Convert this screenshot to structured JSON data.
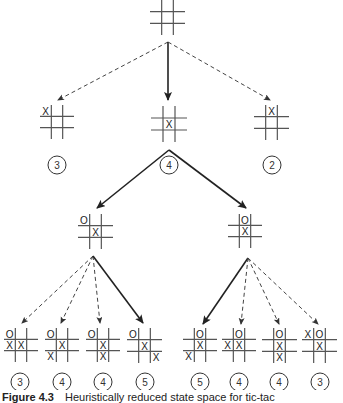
{
  "figure": {
    "label": "Figure 4.3",
    "caption": "Heuristically reduced state space for tic-tac"
  },
  "nodes": [
    {
      "id": "root",
      "x": 150,
      "y": 0,
      "size": 35,
      "marks": [],
      "score": null
    },
    {
      "id": "l1a",
      "x": 40,
      "y": 105,
      "size": 34,
      "marks": [
        {
          "r": 0,
          "c": 0,
          "v": "X"
        }
      ],
      "score": "3",
      "cx": 57,
      "cy": 165
    },
    {
      "id": "l1b",
      "x": 151,
      "y": 106,
      "size": 36,
      "marks": [
        {
          "r": 1,
          "c": 1,
          "v": "X"
        }
      ],
      "score": "4",
      "cx": 169,
      "cy": 165
    },
    {
      "id": "l1c",
      "x": 254,
      "y": 105,
      "size": 35,
      "marks": [
        {
          "r": 0,
          "c": 1,
          "v": "X"
        }
      ],
      "score": "2",
      "cx": 272,
      "cy": 165
    },
    {
      "id": "l2a",
      "x": 78,
      "y": 214,
      "size": 35,
      "marks": [
        {
          "r": 0,
          "c": 0,
          "v": "O"
        },
        {
          "r": 1,
          "c": 1,
          "v": "X"
        }
      ],
      "score": null
    },
    {
      "id": "l2b",
      "x": 228,
      "y": 214,
      "size": 34,
      "marks": [
        {
          "r": 0,
          "c": 1,
          "v": "O"
        },
        {
          "r": 1,
          "c": 1,
          "v": "X"
        }
      ],
      "score": null
    },
    {
      "id": "l3a",
      "x": 4,
      "y": 328,
      "size": 34,
      "marks": [
        {
          "r": 0,
          "c": 0,
          "v": "O"
        },
        {
          "r": 1,
          "c": 0,
          "v": "X"
        },
        {
          "r": 1,
          "c": 1,
          "v": "X"
        }
      ],
      "score": "3",
      "cx": 20,
      "cy": 382
    },
    {
      "id": "l3b",
      "x": 45,
      "y": 328,
      "size": 34,
      "marks": [
        {
          "r": 0,
          "c": 0,
          "v": "O"
        },
        {
          "r": 1,
          "c": 1,
          "v": "X"
        },
        {
          "r": 2,
          "c": 0,
          "v": "X"
        }
      ],
      "score": "4",
      "cx": 62,
      "cy": 382
    },
    {
      "id": "l3c",
      "x": 86,
      "y": 328,
      "size": 34,
      "marks": [
        {
          "r": 0,
          "c": 0,
          "v": "O"
        },
        {
          "r": 1,
          "c": 1,
          "v": "X"
        },
        {
          "r": 2,
          "c": 1,
          "v": "X"
        }
      ],
      "score": "4",
      "cx": 103,
      "cy": 382
    },
    {
      "id": "l3d",
      "x": 127,
      "y": 328,
      "size": 35,
      "marks": [
        {
          "r": 0,
          "c": 0,
          "v": "O"
        },
        {
          "r": 1,
          "c": 1,
          "v": "X"
        },
        {
          "r": 2,
          "c": 2,
          "v": "X"
        }
      ],
      "score": "5",
      "cx": 145,
      "cy": 382
    },
    {
      "id": "l3e",
      "x": 183,
      "y": 328,
      "size": 34,
      "marks": [
        {
          "r": 0,
          "c": 1,
          "v": "O"
        },
        {
          "r": 1,
          "c": 1,
          "v": "X"
        },
        {
          "r": 2,
          "c": 0,
          "v": "X"
        }
      ],
      "score": "5",
      "cx": 200,
      "cy": 382
    },
    {
      "id": "l3f",
      "x": 222,
      "y": 328,
      "size": 34,
      "marks": [
        {
          "r": 0,
          "c": 1,
          "v": "O"
        },
        {
          "r": 1,
          "c": 0,
          "v": "X"
        },
        {
          "r": 1,
          "c": 1,
          "v": "X"
        }
      ],
      "score": "4",
      "cx": 239,
      "cy": 382
    },
    {
      "id": "l3g",
      "x": 262,
      "y": 328,
      "size": 35,
      "marks": [
        {
          "r": 0,
          "c": 1,
          "v": "O"
        },
        {
          "r": 1,
          "c": 1,
          "v": "X"
        },
        {
          "r": 2,
          "c": 1,
          "v": "X"
        }
      ],
      "score": "4",
      "cx": 279,
      "cy": 382
    },
    {
      "id": "l3h",
      "x": 302,
      "y": 328,
      "size": 35,
      "marks": [
        {
          "r": 0,
          "c": 0,
          "v": "X"
        },
        {
          "r": 0,
          "c": 1,
          "v": "O"
        },
        {
          "r": 1,
          "c": 1,
          "v": "X"
        }
      ],
      "score": "3",
      "cx": 320,
      "cy": 382
    }
  ],
  "edges": [
    {
      "x1": 168,
      "y1": 42,
      "x2": 58,
      "y2": 100,
      "style": "dashed"
    },
    {
      "x1": 168,
      "y1": 42,
      "x2": 168,
      "y2": 100,
      "style": "solid"
    },
    {
      "x1": 168,
      "y1": 42,
      "x2": 270,
      "y2": 100,
      "style": "dashed"
    },
    {
      "x1": 169,
      "y1": 150,
      "x2": 97,
      "y2": 208,
      "style": "solid"
    },
    {
      "x1": 169,
      "y1": 150,
      "x2": 246,
      "y2": 208,
      "style": "solid"
    },
    {
      "x1": 93,
      "y1": 256,
      "x2": 22,
      "y2": 323,
      "style": "dashed"
    },
    {
      "x1": 93,
      "y1": 256,
      "x2": 61,
      "y2": 323,
      "style": "dashed"
    },
    {
      "x1": 93,
      "y1": 256,
      "x2": 100,
      "y2": 323,
      "style": "dashed"
    },
    {
      "x1": 93,
      "y1": 256,
      "x2": 143,
      "y2": 323,
      "style": "solid"
    },
    {
      "x1": 248,
      "y1": 258,
      "x2": 203,
      "y2": 324,
      "style": "solid"
    },
    {
      "x1": 248,
      "y1": 258,
      "x2": 241,
      "y2": 324,
      "style": "dashed"
    },
    {
      "x1": 248,
      "y1": 258,
      "x2": 279,
      "y2": 324,
      "style": "dashed"
    },
    {
      "x1": 248,
      "y1": 258,
      "x2": 318,
      "y2": 324,
      "style": "dashed"
    }
  ],
  "colors": {
    "line": "#333333",
    "grid": "#555555",
    "background": "#ffffff"
  }
}
